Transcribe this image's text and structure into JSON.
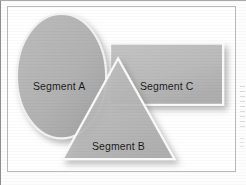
{
  "figure": {
    "type": "overlapping-shapes-diagram",
    "shapes": [
      {
        "id": "segment-a",
        "kind": "ellipse",
        "label": "Segment A",
        "fill": "#b2b2b2",
        "outline": "#f2f2f2"
      },
      {
        "id": "segment-b",
        "kind": "triangle",
        "label": "Segment B",
        "fill": "#b8b8b8",
        "outline": "#fafafa"
      },
      {
        "id": "segment-c",
        "kind": "rectangle",
        "label": "Segment C",
        "fill": "#bcbcbc",
        "outline": "#fbfbfb"
      }
    ],
    "frame_color": "#b9b9b9",
    "background": "#ffffff",
    "label_color": "#141414"
  }
}
